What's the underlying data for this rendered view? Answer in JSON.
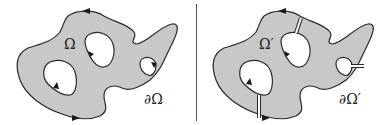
{
  "figure": {
    "left_panel": {
      "region_label": "Ω",
      "boundary_label": "∂Ω",
      "description": "Multiply connected region with three holes; boundary oriented with arrows"
    },
    "right_panel": {
      "region_label": "Ω′",
      "boundary_label": "∂Ω′",
      "description": "Same region with cuts connecting holes to outer boundary, making it simply connected"
    },
    "colors": {
      "fill": "#c8c8c8",
      "stroke": "#2a2a2a",
      "background": "#ffffff",
      "divider": "#555555"
    }
  }
}
